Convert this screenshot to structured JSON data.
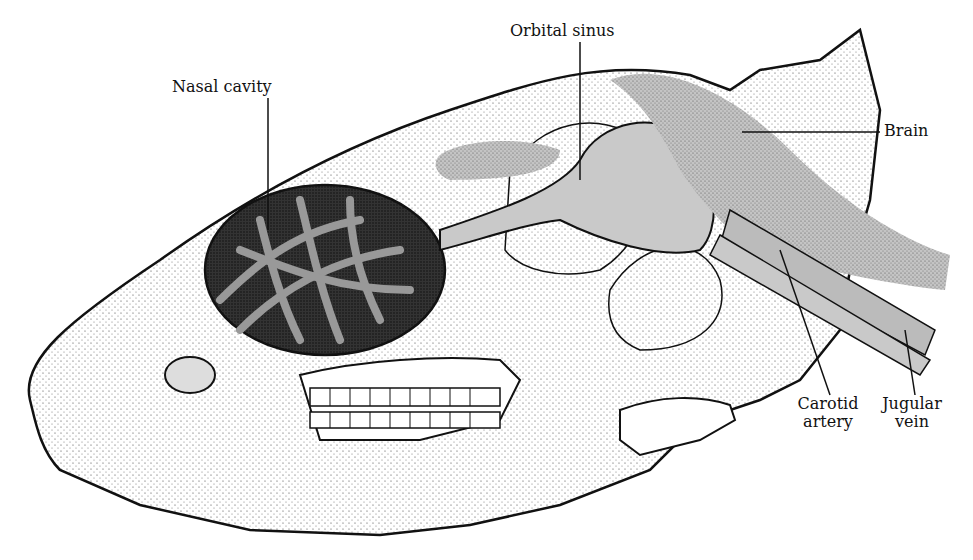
{
  "diagram": {
    "labels": {
      "nasal_cavity": "Nasal cavity",
      "orbital_sinus": "Orbital sinus",
      "brain": "Brain",
      "carotid_artery_line1": "Carotid",
      "carotid_artery_line2": "artery",
      "jugular_vein_line1": "Jugular",
      "jugular_vein_line2": "vein"
    },
    "colors": {
      "outline": "#111111",
      "vessel_fill": "#c9c9c9",
      "stipple": "#555555",
      "background": "#ffffff"
    }
  }
}
